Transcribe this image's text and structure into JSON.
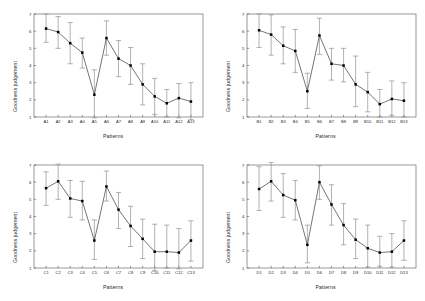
{
  "figure": {
    "panel_count": 4,
    "layout": "2x2",
    "background": "#ffffff",
    "line_color": "#3a3a3a",
    "marker_color": "#000000",
    "errorbar_color": "#888888",
    "axis_color": "#555555"
  },
  "chart_data": [
    {
      "type": "line",
      "panel": "A",
      "title": "",
      "xlabel": "Patterns",
      "ylabel": "Goodness judgement",
      "ylim": [
        1,
        7
      ],
      "yticks": [
        1,
        2,
        3,
        4,
        5,
        6,
        7
      ],
      "grid": false,
      "legend": "none",
      "categories": [
        "A1",
        "A2",
        "A3",
        "A4",
        "A5",
        "A6",
        "A7",
        "A8",
        "A9",
        "A10",
        "A11",
        "A12",
        "A13"
      ],
      "values": [
        6.15,
        5.95,
        5.3,
        4.75,
        2.3,
        5.6,
        4.4,
        4.0,
        2.9,
        2.2,
        1.8,
        2.1,
        1.9
      ],
      "error_low": [
        5.35,
        5.0,
        4.1,
        3.85,
        0.95,
        4.6,
        3.35,
        2.9,
        1.7,
        1.15,
        1.0,
        0.95,
        0.85
      ],
      "error_high": [
        7.0,
        6.85,
        6.5,
        5.6,
        3.75,
        6.6,
        5.45,
        5.05,
        4.1,
        3.25,
        2.6,
        2.95,
        3.0
      ]
    },
    {
      "type": "line",
      "panel": "B",
      "title": "",
      "xlabel": "Patterns",
      "ylabel": "Goodness judgement",
      "ylim": [
        1,
        7
      ],
      "yticks": [
        1,
        2,
        3,
        4,
        5,
        6,
        7
      ],
      "grid": false,
      "legend": "none",
      "categories": [
        "B1",
        "B2",
        "B3",
        "B4",
        "B5",
        "B6",
        "B7",
        "B8",
        "B9",
        "B10",
        "B11",
        "B12",
        "B13"
      ],
      "values": [
        6.05,
        5.8,
        5.15,
        4.85,
        2.5,
        5.75,
        4.1,
        4.0,
        2.9,
        2.45,
        1.75,
        2.05,
        1.95
      ],
      "error_low": [
        5.05,
        4.6,
        4.1,
        3.6,
        1.5,
        4.65,
        3.15,
        3.05,
        1.6,
        1.3,
        1.0,
        1.1,
        1.0
      ],
      "error_high": [
        7.0,
        6.95,
        6.25,
        6.1,
        3.55,
        6.75,
        5.0,
        5.0,
        4.55,
        3.6,
        2.6,
        3.1,
        3.0
      ]
    },
    {
      "type": "line",
      "panel": "C",
      "title": "",
      "xlabel": "Patterns",
      "ylabel": "Goodness judgement",
      "ylim": [
        1,
        7
      ],
      "yticks": [
        1,
        2,
        3,
        4,
        5,
        6,
        7
      ],
      "grid": false,
      "legend": "none",
      "categories": [
        "C1",
        "C2",
        "C3",
        "C4",
        "C5",
        "C6",
        "C7",
        "C8",
        "C9",
        "C10",
        "C11",
        "C12",
        "C13"
      ],
      "values": [
        5.65,
        6.05,
        5.05,
        4.9,
        2.6,
        5.75,
        4.4,
        3.45,
        2.7,
        1.95,
        1.95,
        1.9,
        2.6
      ],
      "error_low": [
        4.65,
        5.0,
        3.95,
        3.8,
        1.5,
        4.9,
        3.3,
        2.25,
        1.55,
        0.85,
        1.0,
        0.95,
        1.4
      ],
      "error_high": [
        6.6,
        7.05,
        6.1,
        6.05,
        3.8,
        6.65,
        5.4,
        4.6,
        3.85,
        3.55,
        3.5,
        3.3,
        3.75
      ]
    },
    {
      "type": "line",
      "panel": "D",
      "title": "",
      "xlabel": "Patterns",
      "ylabel": "Goodness judgement",
      "ylim": [
        1,
        7
      ],
      "yticks": [
        1,
        2,
        3,
        4,
        5,
        6,
        7
      ],
      "grid": false,
      "legend": "none",
      "categories": [
        "D1",
        "D2",
        "D3",
        "D4",
        "D5",
        "D6",
        "D7",
        "D8",
        "D9",
        "D10",
        "D11",
        "D12",
        "D13"
      ],
      "values": [
        5.6,
        6.05,
        5.25,
        4.95,
        2.35,
        6.0,
        4.7,
        3.5,
        2.65,
        2.15,
        1.9,
        1.95,
        2.6
      ],
      "error_low": [
        4.35,
        4.9,
        3.95,
        3.8,
        1.3,
        5.0,
        3.5,
        2.35,
        1.55,
        1.05,
        1.1,
        1.05,
        1.45
      ],
      "error_high": [
        6.9,
        7.15,
        6.5,
        6.1,
        3.5,
        6.95,
        5.85,
        4.75,
        3.85,
        3.5,
        2.85,
        3.0,
        3.75
      ]
    }
  ]
}
